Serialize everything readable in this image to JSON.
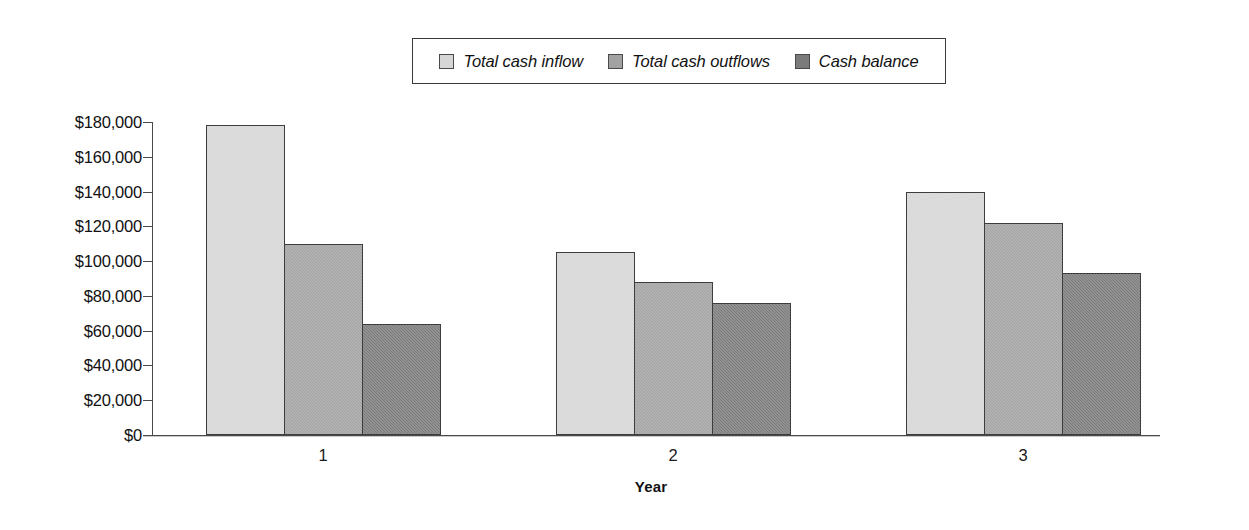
{
  "chart_data": {
    "type": "bar",
    "title": "",
    "subtitle": "",
    "xlabel": "Year",
    "ylabel": "",
    "categories": [
      "1",
      "2",
      "3"
    ],
    "series": [
      {
        "name": "Total cash inflow",
        "color": "#d6d6d6",
        "values": [
          178000,
          105000,
          140000
        ]
      },
      {
        "name": "Total cash outflows",
        "color": "#a2a2a2",
        "values": [
          110000,
          88000,
          122000
        ]
      },
      {
        "name": "Cash balance",
        "color": "#7b7b7b",
        "values": [
          64000,
          76000,
          93000
        ]
      }
    ],
    "ylim": [
      0,
      180000
    ],
    "ytick_values": [
      0,
      20000,
      40000,
      60000,
      80000,
      100000,
      120000,
      140000,
      160000,
      180000
    ],
    "ytick_labels": [
      "$0",
      "$20,000",
      "$40,000",
      "$60,000",
      "$80,000",
      "$100,000",
      "$120,000",
      "$140,000",
      "$160,000",
      "$180,000"
    ],
    "grid": false,
    "legend_position": "top-center",
    "axis_color": "#4a4a4a",
    "bar_border_color": "#3d3d3d",
    "background": "#ffffff"
  },
  "legend": {
    "entries": [
      {
        "label": "Total cash inflow",
        "swatch_color": "#d6d6d6"
      },
      {
        "label": "Total cash outflows",
        "swatch_color": "#a2a2a2"
      },
      {
        "label": "Cash balance",
        "swatch_color": "#7b7b7b"
      }
    ]
  },
  "axes": {
    "x_title": "Year",
    "x_tick_labels": [
      "1",
      "2",
      "3"
    ],
    "y_tick_labels": [
      "$180,000",
      "$160,000",
      "$140,000",
      "$120,000",
      "$100,000",
      "$80,000",
      "$60,000",
      "$40,000",
      "$20,000",
      "$0"
    ]
  }
}
